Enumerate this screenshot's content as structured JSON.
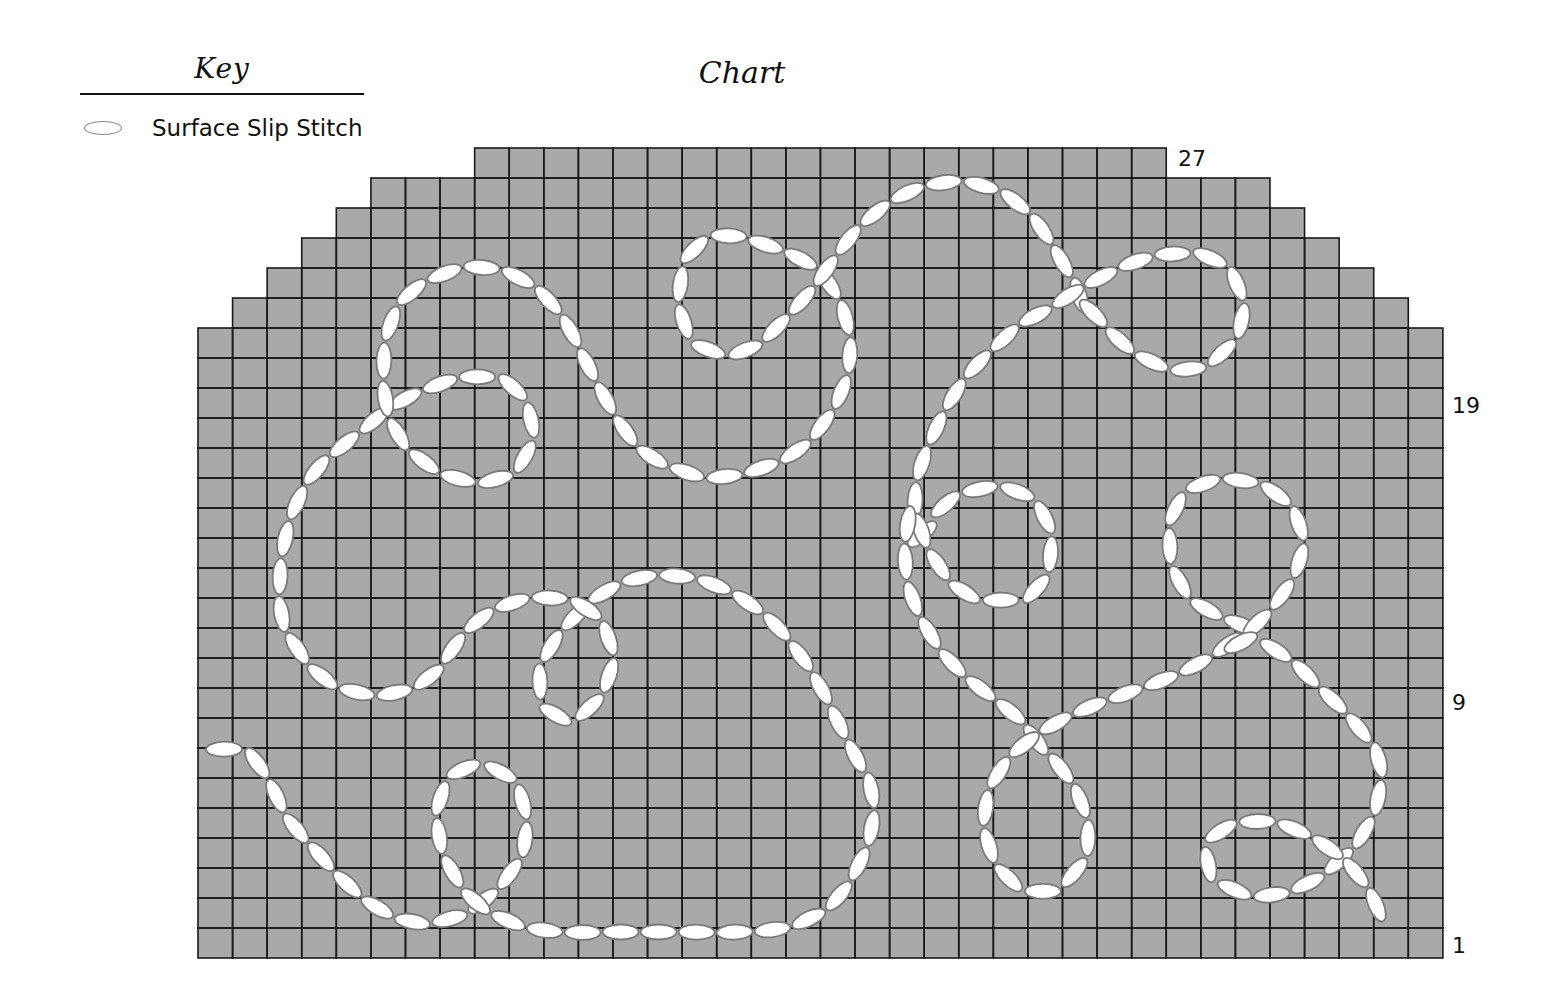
{
  "key": {
    "title": "Key",
    "items": [
      {
        "symbol": "oval-stitch-icon",
        "label": "Surface Slip Stitch"
      }
    ]
  },
  "chart": {
    "title": "Chart",
    "row_labels": [
      {
        "row": 27,
        "text": "27"
      },
      {
        "row": 19,
        "text": "19"
      },
      {
        "row": 9,
        "text": "9"
      },
      {
        "row": 1,
        "text": "1"
      }
    ]
  },
  "colors": {
    "grid_fill": "#a9a9a9",
    "grid_line": "#1a1a1a",
    "stitch_fill": "#ffffff",
    "stitch_stroke": "#7a7a7a"
  },
  "chart_data": {
    "type": "table",
    "title": "Chart",
    "columns": 36,
    "rows": 27,
    "row_numbers_shown": [
      1,
      9,
      19,
      27
    ],
    "row_spans": [
      {
        "row": 27,
        "first_col": 9,
        "last_col": 28
      },
      {
        "row": 26,
        "first_col": 6,
        "last_col": 31
      },
      {
        "row": 25,
        "first_col": 5,
        "last_col": 32
      },
      {
        "row": 24,
        "first_col": 4,
        "last_col": 33
      },
      {
        "row": 23,
        "first_col": 3,
        "last_col": 34
      },
      {
        "row": 22,
        "first_col": 2,
        "last_col": 35
      },
      {
        "row": 21,
        "first_col": 1,
        "last_col": 36
      },
      {
        "row": "1-20",
        "first_col": 1,
        "last_col": 36
      }
    ],
    "legend": [
      {
        "symbol": "oval",
        "meaning": "Surface Slip Stitch"
      }
    ],
    "geometry": {
      "left": 198,
      "top": 148,
      "cell_w": 34.58,
      "cell_h": 30.0
    },
    "stitch_paths": [
      {
        "name": "bottom-left-tail-and-small-loop",
        "closed": false,
        "points": [
          [
            205,
            750
          ],
          [
            245,
            752
          ],
          [
            268,
            780
          ],
          [
            288,
            818
          ],
          [
            315,
            850
          ],
          [
            345,
            882
          ],
          [
            378,
            908
          ],
          [
            415,
            922
          ],
          [
            452,
            918
          ],
          [
            478,
            905
          ],
          [
            505,
            880
          ],
          [
            524,
            845
          ],
          [
            522,
            800
          ],
          [
            500,
            772
          ],
          [
            462,
            770
          ],
          [
            440,
            800
          ],
          [
            440,
            840
          ],
          [
            455,
            876
          ],
          [
            480,
            905
          ],
          [
            520,
            925
          ],
          [
            565,
            932
          ],
          [
            620,
            932
          ],
          [
            680,
            932
          ],
          [
            740,
            932
          ],
          [
            790,
            926
          ],
          [
            830,
            905
          ],
          [
            857,
            868
          ],
          [
            872,
            825
          ],
          [
            870,
            785
          ],
          [
            855,
            755
          ],
          [
            842,
            730
          ],
          [
            822,
            690
          ],
          [
            800,
            655
          ],
          [
            770,
            620
          ],
          [
            730,
            592
          ],
          [
            685,
            577
          ],
          [
            640,
            578
          ],
          [
            605,
            592
          ],
          [
            580,
            612
          ],
          [
            555,
            640
          ],
          [
            540,
            675
          ],
          [
            548,
            708
          ],
          [
            572,
            718
          ],
          [
            598,
            698
          ],
          [
            612,
            662
          ],
          [
            604,
            628
          ],
          [
            582,
            606
          ],
          [
            550,
            598
          ],
          [
            515,
            602
          ],
          [
            482,
            618
          ],
          [
            458,
            642
          ],
          [
            435,
            672
          ],
          [
            405,
            690
          ],
          [
            368,
            694
          ],
          [
            330,
            682
          ],
          [
            302,
            655
          ],
          [
            283,
            620
          ],
          [
            280,
            580
          ],
          [
            285,
            540
          ],
          [
            296,
            505
          ],
          [
            315,
            472
          ],
          [
            340,
            448
          ],
          [
            365,
            428
          ],
          [
            390,
            408
          ],
          [
            420,
            392
          ],
          [
            462,
            378
          ],
          [
            500,
            380
          ],
          [
            522,
            398
          ],
          [
            532,
            428
          ],
          [
            524,
            458
          ],
          [
            500,
            478
          ],
          [
            465,
            480
          ],
          [
            430,
            466
          ],
          [
            402,
            440
          ],
          [
            388,
            410
          ],
          [
            384,
            380
          ],
          [
            386,
            340
          ],
          [
            400,
            305
          ],
          [
            425,
            283
          ],
          [
            465,
            268
          ],
          [
            505,
            272
          ],
          [
            540,
            292
          ],
          [
            565,
            322
          ],
          [
            580,
            350
          ],
          [
            598,
            385
          ],
          [
            618,
            420
          ],
          [
            640,
            448
          ],
          [
            670,
            466
          ],
          [
            710,
            477
          ],
          [
            755,
            470
          ],
          [
            795,
            452
          ],
          [
            822,
            425
          ],
          [
            842,
            390
          ],
          [
            850,
            350
          ],
          [
            843,
            310
          ],
          [
            828,
            282
          ],
          [
            815,
            268
          ],
          [
            792,
            255
          ],
          [
            760,
            243
          ],
          [
            722,
            236
          ],
          [
            692,
            252
          ],
          [
            680,
            288
          ],
          [
            685,
            325
          ],
          [
            705,
            348
          ],
          [
            738,
            352
          ],
          [
            765,
            338
          ],
          [
            795,
            308
          ],
          [
            815,
            285
          ],
          [
            832,
            262
          ],
          [
            855,
            232
          ],
          [
            885,
            206
          ],
          [
            920,
            188
          ],
          [
            960,
            182
          ],
          [
            1000,
            192
          ],
          [
            1030,
            215
          ],
          [
            1050,
            242
          ],
          [
            1068,
            272
          ],
          [
            1078,
            292
          ],
          [
            1080,
            300
          ]
        ]
      },
      {
        "name": "right-upper-loop-and-long-stroke",
        "closed": false,
        "points": [
          [
            1080,
            300
          ],
          [
            1098,
            318
          ],
          [
            1125,
            345
          ],
          [
            1160,
            365
          ],
          [
            1195,
            368
          ],
          [
            1225,
            350
          ],
          [
            1242,
            318
          ],
          [
            1235,
            280
          ],
          [
            1210,
            258
          ],
          [
            1172,
            254
          ],
          [
            1135,
            262
          ],
          [
            1100,
            278
          ],
          [
            1075,
            292
          ],
          [
            1050,
            308
          ],
          [
            1020,
            325
          ],
          [
            992,
            350
          ],
          [
            968,
            375
          ],
          [
            948,
            405
          ],
          [
            932,
            438
          ],
          [
            920,
            470
          ],
          [
            915,
            505
          ],
          [
            920,
            535
          ],
          [
            935,
            515
          ],
          [
            955,
            498
          ],
          [
            988,
            488
          ],
          [
            1022,
            494
          ],
          [
            1046,
            520
          ],
          [
            1050,
            558
          ],
          [
            1035,
            590
          ],
          [
            1005,
            600
          ],
          [
            968,
            594
          ],
          [
            942,
            570
          ],
          [
            925,
            540
          ],
          [
            912,
            510
          ],
          [
            905,
            550
          ],
          [
            910,
            590
          ],
          [
            925,
            625
          ],
          [
            945,
            655
          ],
          [
            970,
            680
          ],
          [
            998,
            702
          ],
          [
            1022,
            722
          ],
          [
            1040,
            745
          ],
          [
            1062,
            770
          ],
          [
            1080,
            800
          ],
          [
            1088,
            835
          ],
          [
            1080,
            865
          ],
          [
            1052,
            890
          ],
          [
            1018,
            885
          ],
          [
            995,
            860
          ],
          [
            985,
            825
          ],
          [
            990,
            790
          ],
          [
            1008,
            760
          ],
          [
            1030,
            740
          ],
          [
            1058,
            722
          ],
          [
            1090,
            707
          ],
          [
            1130,
            692
          ],
          [
            1170,
            677
          ],
          [
            1205,
            660
          ],
          [
            1235,
            640
          ],
          [
            1250,
            630
          ],
          [
            1230,
            620
          ],
          [
            1200,
            605
          ],
          [
            1180,
            582
          ],
          [
            1170,
            548
          ],
          [
            1175,
            510
          ],
          [
            1198,
            486
          ],
          [
            1235,
            480
          ],
          [
            1270,
            490
          ],
          [
            1295,
            515
          ],
          [
            1302,
            548
          ],
          [
            1290,
            582
          ],
          [
            1268,
            612
          ],
          [
            1248,
            632
          ],
          [
            1235,
            645
          ],
          [
            1255,
            640
          ],
          [
            1290,
            660
          ],
          [
            1320,
            688
          ],
          [
            1352,
            720
          ],
          [
            1378,
            758
          ],
          [
            1378,
            798
          ],
          [
            1362,
            835
          ],
          [
            1340,
            860
          ],
          [
            1310,
            882
          ],
          [
            1270,
            895
          ],
          [
            1235,
            890
          ],
          [
            1210,
            870
          ],
          [
            1212,
            840
          ],
          [
            1235,
            825
          ],
          [
            1270,
            822
          ],
          [
            1305,
            834
          ],
          [
            1338,
            855
          ],
          [
            1360,
            878
          ],
          [
            1376,
            905
          ],
          [
            1384,
            935
          ]
        ]
      }
    ]
  }
}
